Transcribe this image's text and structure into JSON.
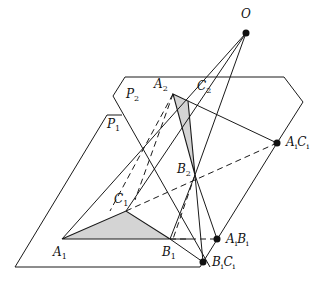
{
  "diagram": {
    "title": "",
    "colors": {
      "line": "#1a1a1a",
      "fill": "#d4d4d4",
      "background": "#ffffff"
    },
    "points": {
      "O": {
        "label": "O",
        "sub": "",
        "x": 246,
        "y": 33,
        "dot": true,
        "lx": 239,
        "ly": 10
      },
      "A2": {
        "label": "A",
        "sub": "2",
        "x": 173,
        "y": 94,
        "dot": false,
        "lx": 154,
        "ly": 80
      },
      "C2": {
        "label": "C",
        "sub": "2",
        "x": 188,
        "y": 101,
        "dot": false,
        "lx": 197,
        "ly": 80
      },
      "B2": {
        "label": "B",
        "sub": "2",
        "x": 195,
        "y": 175,
        "dot": false,
        "lx": 177,
        "ly": 163
      },
      "A1": {
        "label": "A",
        "sub": "1",
        "x": 62,
        "y": 239,
        "dot": false,
        "lx": 53,
        "ly": 245
      },
      "B1": {
        "label": "B",
        "sub": "1",
        "x": 170,
        "y": 239,
        "dot": false,
        "lx": 161,
        "ly": 245
      },
      "C1": {
        "label": "C",
        "sub": "1",
        "x": 126,
        "y": 211,
        "dot": false,
        "lx": 114,
        "ly": 191
      },
      "AiCi": {
        "label": "A",
        "sub": "i",
        "label2": "C",
        "sub2": "i",
        "x": 277,
        "y": 143,
        "dot": true,
        "lx": 287,
        "ly": 136
      },
      "AiBi": {
        "label": "A",
        "sub": "i",
        "label2": "B",
        "sub2": "i",
        "x": 217,
        "y": 239,
        "dot": true,
        "lx": 226,
        "ly": 233
      },
      "BiCi": {
        "label": "B",
        "sub": "i",
        "label2": "C",
        "sub2": "i",
        "x": 203,
        "y": 262,
        "dot": true,
        "lx": 212,
        "ly": 256
      }
    },
    "planes": [
      {
        "label": "P",
        "sub": "2",
        "lx": 127,
        "ly": 89
      },
      {
        "label": "P",
        "sub": "1",
        "lx": 107,
        "ly": 118
      }
    ]
  }
}
